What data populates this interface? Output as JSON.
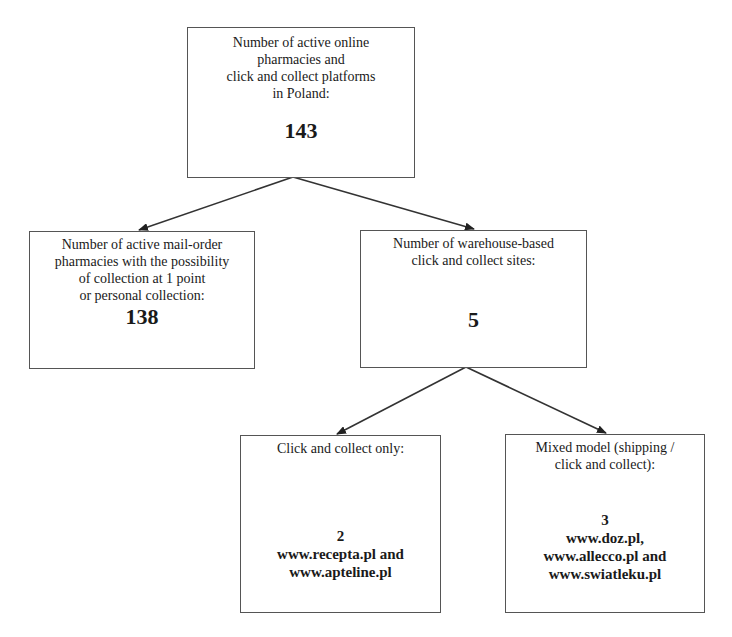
{
  "diagram": {
    "root": {
      "label_lines": [
        "Number of active online",
        "pharmacies and",
        "click and collect platforms",
        "in Poland:"
      ],
      "value": "143"
    },
    "mail_order": {
      "label_lines": [
        "Number of active mail-order",
        "pharmacies with the possibility",
        "of collection at 1 point",
        "or personal collection:"
      ],
      "value": "138"
    },
    "warehouse": {
      "label_lines": [
        "Number of warehouse-based",
        "click and collect sites:"
      ],
      "value": "5"
    },
    "click_collect_only": {
      "label_lines": [
        "Click and collect only:"
      ],
      "value": "2",
      "sites_lines": [
        "www.recepta.pl and",
        "www.apteline.pl"
      ]
    },
    "mixed_model": {
      "label_lines": [
        "Mixed model (shipping /",
        "click and collect):"
      ],
      "value": "3",
      "sites_lines": [
        "www.doz.pl,",
        "www.allecco.pl and",
        "www.swiatleku.pl"
      ]
    },
    "edges": [
      {
        "from": "root",
        "to": "mail_order"
      },
      {
        "from": "root",
        "to": "warehouse"
      },
      {
        "from": "warehouse",
        "to": "click_collect_only"
      },
      {
        "from": "warehouse",
        "to": "mixed_model"
      }
    ],
    "colors": {
      "border": "#555555",
      "line": "#333333",
      "text": "#1a1a1a",
      "background": "#ffffff"
    }
  }
}
